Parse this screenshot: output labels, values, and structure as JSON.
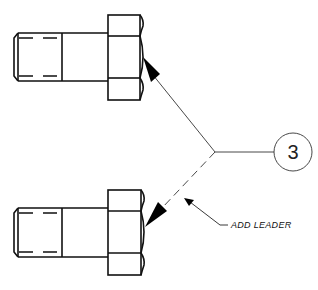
{
  "drawing": {
    "type": "technical-drawing",
    "subject": "hex-head-bolt-leader-callout",
    "line_color": "#111111",
    "background": "#ffffff"
  },
  "parts": [
    {
      "name": "upper-bolt",
      "view": "side"
    },
    {
      "name": "lower-bolt",
      "view": "side"
    }
  ],
  "balloon": {
    "label": "3"
  },
  "leaders": [
    {
      "name": "existing-leader",
      "style": "solid",
      "target": "upper-bolt"
    },
    {
      "name": "added-leader",
      "style": "dashed",
      "target": "lower-bolt"
    }
  ],
  "annotation": {
    "text": "ADD LEADER"
  }
}
